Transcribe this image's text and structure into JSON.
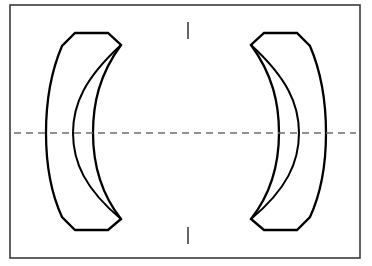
{
  "figure": {
    "width": 372,
    "height": 266,
    "background_color": "#ffffff"
  },
  "colors": {
    "background": "#ffffff",
    "frame_stroke": "#3b3b3b",
    "lens_stroke": "#000000",
    "lens_fill": "#ffffff",
    "axis_stroke": "#6e6e6e",
    "tick_stroke": "#4a4a4a"
  },
  "frame": {
    "name": "drawing-border",
    "x": 10,
    "y": 5,
    "width": 350,
    "height": 253,
    "stroke_width": 1.6
  },
  "optical_axis": {
    "name": "horizontal-centerline",
    "orientation": "horizontal",
    "y": 133,
    "x_start": 14,
    "x_end": 356,
    "style": "dashed",
    "dash_length": 7,
    "gap_length": 5
  },
  "axis_ticks": [
    {
      "name": "center-tick-top",
      "x": 188,
      "y_start": 22,
      "y_end": 39,
      "orientation": "vertical"
    },
    {
      "name": "center-tick-bottom",
      "x": 188,
      "y_start": 227,
      "y_end": 244,
      "orientation": "vertical"
    }
  ],
  "elements": [
    {
      "name": "left-lens-element",
      "type": "meniscus-lens",
      "side": "left",
      "concave_toward": "right",
      "outline_path": "M 75 33 L 108 33 L 121 45 C 99 75 93 104 93 133 C 93 162 99 191 121 219 L 108 230 L 75 230 L 62 217 C 50 191 46 162 46 133 C 46 104 50 74 62 46 Z",
      "inner_curve_path": "M 121 45 C 85 78 73 104 73 133 C 73 162 85 189 121 219",
      "vertex_top": {
        "x": 121,
        "y": 45
      },
      "vertex_bottom": {
        "x": 121,
        "y": 219
      },
      "flat_top_y": 33,
      "flat_bottom_y": 230,
      "outer_bulge_x": 46,
      "inner_surface_x_at_axis": 93
    },
    {
      "name": "right-lens-element",
      "type": "meniscus-lens",
      "side": "right",
      "concave_toward": "left",
      "outline_path": "M 297 33 L 264 33 L 251 45 C 273 75 279 104 279 133 C 279 162 273 191 251 219 L 264 230 L 297 230 L 310 217 C 322 191 326 162 326 133 C 326 104 322 74 310 46 Z",
      "inner_curve_path": "M 251 45 C 287 78 299 104 299 133 C 299 162 287 189 251 219",
      "vertex_top": {
        "x": 251,
        "y": 45
      },
      "vertex_bottom": {
        "x": 251,
        "y": 219
      },
      "flat_top_y": 33,
      "flat_bottom_y": 230,
      "outer_bulge_x": 326,
      "inner_surface_x_at_axis": 279
    }
  ],
  "labels": {
    "left_lens": "Left meniscus lens element",
    "right_lens": "Right meniscus lens element",
    "axis": "Optical axis centerline"
  }
}
